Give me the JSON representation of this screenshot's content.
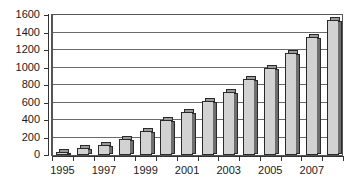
{
  "chart_data": {
    "type": "bar",
    "title": "",
    "subtitle": "",
    "xlabel": "",
    "ylabel": "",
    "categories": [
      "1995",
      "1996",
      "1997",
      "1998",
      "1999",
      "2000",
      "2001",
      "2002",
      "2003",
      "2004",
      "2005",
      "2006",
      "2007",
      "2008"
    ],
    "values": [
      40,
      80,
      120,
      180,
      270,
      400,
      490,
      620,
      720,
      870,
      1000,
      1170,
      1350,
      1540
    ],
    "series": [
      {
        "name": "",
        "values": [
          40,
          80,
          120,
          180,
          270,
          400,
          490,
          620,
          720,
          870,
          1000,
          1170,
          1350,
          1540
        ]
      }
    ],
    "ylim": [
      0,
      1600
    ],
    "y_ticks": [
      0,
      200,
      400,
      600,
      800,
      1000,
      1200,
      1400,
      1600
    ],
    "y_tick_labels": [
      "0",
      "200",
      "400",
      "600",
      "800",
      "1000",
      "1200",
      "1400",
      "1600"
    ],
    "x_tick_labels": [
      "1995",
      "1997",
      "1999",
      "2001",
      "2003",
      "2005",
      "2007"
    ],
    "x_tick_label_indices": [
      0,
      2,
      4,
      6,
      8,
      10,
      12
    ],
    "grid": true,
    "grid_axis": "y",
    "legend": false,
    "legend_position": "none",
    "bar_style": "3d-column",
    "colors": {
      "bar_fill": "#d2d2d2",
      "bar_outline": "#2a2a2a",
      "bar_side_face": "#6e6e6e",
      "bar_top_face": "#9a9a9a",
      "gridline": "#6b6b6b",
      "axis": "#333333",
      "plot_border": "#555555",
      "background": "#ffffff",
      "text": "#1a1a1a"
    }
  }
}
